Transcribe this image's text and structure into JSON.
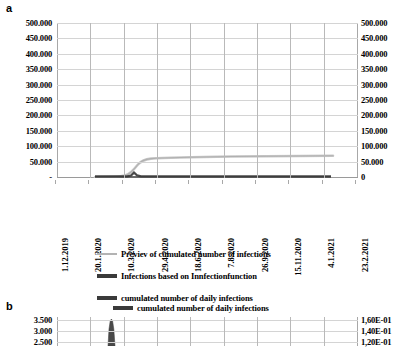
{
  "panel_a": {
    "letter": "a",
    "y_axis_left": {
      "ticks": [
        "500.000",
        "450.000",
        "400.000",
        "350.000",
        "300.000",
        "250.000",
        "200.000",
        "150.000",
        "100.000",
        "50.000",
        "-"
      ]
    },
    "y_axis_right": {
      "ticks": [
        "500.000",
        "450.000",
        "400.000",
        "350.000",
        "300.000",
        "250.000",
        "200.000",
        "150.000",
        "100.000",
        "50.000",
        "0"
      ]
    },
    "x_axis": {
      "ticks": [
        "1.12.2019",
        "20.1.2020",
        "10.3.2020",
        "29.4.2020",
        "18.6.2020",
        "7.8.2020",
        "26.9.2020",
        "15.11.2020",
        "4.1.2021",
        "23.2.2021"
      ]
    }
  },
  "legend": {
    "items": [
      {
        "label": "Previev of cumulated number of infections",
        "style": "thin",
        "color": "#b3b3b3"
      },
      {
        "label": "Infections based on Innfectionfunction",
        "style": "thick",
        "color": "#3a3a3a"
      },
      {
        "label": "cumulated number of daily infections",
        "style": "thick",
        "color": "#3a3a3a"
      }
    ]
  },
  "panel_b": {
    "letter": "b",
    "legend_label": "cumulated number of daily infections",
    "y_axis_left": {
      "ticks": [
        "3.500",
        "3.000",
        "2.500"
      ]
    },
    "y_axis_right": {
      "ticks": [
        "1,60E-01",
        "1,40E-01",
        "1,20E-01"
      ]
    }
  },
  "chart_data": [
    {
      "type": "line",
      "panel": "a",
      "title": "",
      "xlabel": "",
      "ylabel": "",
      "ylim": [
        0,
        500000
      ],
      "ytick_step": 50000,
      "grid": true,
      "legend_position": "below",
      "x": [
        "1.12.2019",
        "20.1.2020",
        "10.3.2020",
        "29.4.2020",
        "18.6.2020",
        "7.8.2020",
        "26.9.2020",
        "15.11.2020",
        "4.1.2021",
        "23.2.2021"
      ],
      "series": [
        {
          "name": "Previev of cumulated number of infections",
          "color": "#b3b3b3",
          "values": [
            0,
            0,
            2000,
            38000,
            43000,
            44500,
            45000,
            45500,
            46000,
            null
          ],
          "note": "sigmoid rise beginning mid-March 2020, plateau near 45.000"
        },
        {
          "name": "Infections based on Innfectionfunction",
          "color": "#3a3a3a",
          "values": [
            0,
            0,
            1500,
            800,
            400,
            300,
            250,
            200,
            150,
            null
          ],
          "note": "near-zero flat line along baseline with small bump in March 2020"
        },
        {
          "name": "cumulated number of daily infections",
          "color": "#3a3a3a",
          "values": [
            0,
            0,
            500,
            300,
            200,
            150,
            120,
            100,
            90,
            null
          ],
          "note": "overlaps baseline"
        }
      ]
    },
    {
      "type": "line",
      "panel": "b",
      "title": "",
      "xlabel": "",
      "ylabel": "",
      "ylim_left": [
        2500,
        3500
      ],
      "ylim_right": [
        0.12,
        0.16
      ],
      "grid": true,
      "legend_position": "top",
      "series": [
        {
          "name": "cumulated number of daily infections",
          "color": "#3a3a3a",
          "note": "single narrow dark spike near 10.3.2020 reaching top of visible range"
        }
      ]
    }
  ]
}
